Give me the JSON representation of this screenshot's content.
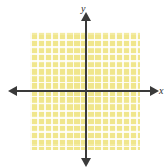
{
  "figure": {
    "type": "coordinate-plane",
    "title": "",
    "background_color": "#ffffff"
  },
  "grid": {
    "fill_color": "#f0e68c",
    "gridline_color": "#ffffff",
    "cell_size_px": 7,
    "columns": 16,
    "rows": 17,
    "left_px": 30,
    "top_px": 32,
    "width_px": 110,
    "height_px": 118
  },
  "axes": {
    "color": "#3a3a3a",
    "x": {
      "label": "x",
      "label_style": "italic",
      "arrowheads": [
        "left",
        "right"
      ],
      "position_y_px": 91,
      "tick_labels": [],
      "numbers_shown": false
    },
    "y": {
      "label": "y",
      "label_style": "italic",
      "arrowheads": [
        "up",
        "down"
      ],
      "position_x_px": 86,
      "tick_labels": [],
      "numbers_shown": false
    },
    "origin": {
      "x_px": 86,
      "y_px": 91
    }
  },
  "plotted_data": {
    "series": [],
    "points": [],
    "curves": [],
    "note": "empty grid — no data plotted"
  }
}
